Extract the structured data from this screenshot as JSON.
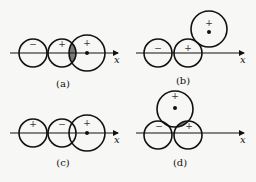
{
  "figure": {
    "axis_label": "x",
    "panels": [
      {
        "id": "a",
        "label": "(a)",
        "signs": [
          "−",
          "+",
          "+"
        ],
        "overlap_shaded": true
      },
      {
        "id": "b",
        "label": "(b)",
        "signs": [
          "−",
          "+",
          "+"
        ],
        "overlap_shaded": true
      },
      {
        "id": "c",
        "label": "(c)",
        "signs": [
          "+",
          "−",
          "+"
        ],
        "overlap_shaded": false
      },
      {
        "id": "d",
        "label": "(d)",
        "signs": [
          "−",
          "+",
          "+"
        ],
        "overlap_shaded": true
      }
    ]
  }
}
